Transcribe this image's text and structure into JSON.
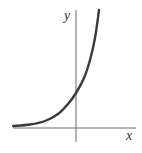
{
  "chart_data": {
    "type": "line",
    "title": "",
    "xlabel": "x",
    "ylabel": "y",
    "series": [
      {
        "name": "exponential growth curve",
        "description": "increasing exponential curve approaching the x-axis as a horizontal asymptote on the left, crossing the positive y-axis, rising steeply on the right",
        "points_px": [
          [
            13,
            126
          ],
          [
            30,
            124.5
          ],
          [
            45,
            121
          ],
          [
            58,
            114
          ],
          [
            68,
            104
          ],
          [
            76,
            93
          ],
          [
            84,
            78
          ],
          [
            90,
            60
          ],
          [
            95,
            38
          ],
          [
            99,
            10
          ]
        ]
      }
    ],
    "x_axis": {
      "label": "x",
      "ticks": []
    },
    "y_axis": {
      "label": "y",
      "ticks": []
    },
    "grid": false,
    "legend": null
  },
  "labels": {
    "x": "x",
    "y": "y"
  },
  "colors": {
    "curve": "#3a3a3a",
    "axis": "#6a6a6a",
    "background": "#ffffff"
  }
}
